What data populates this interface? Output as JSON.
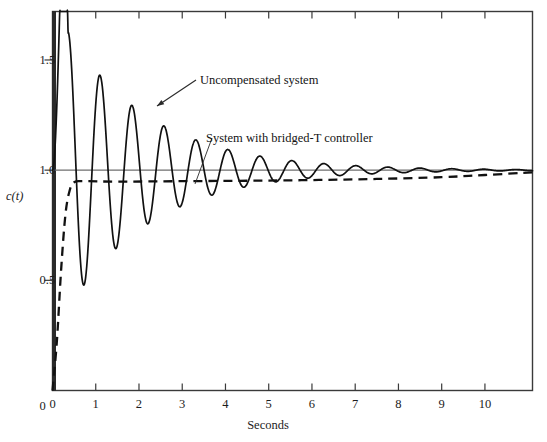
{
  "chart_data": {
    "type": "line",
    "title": "",
    "xlabel": "Seconds",
    "ylabel": "c(t)",
    "xlim": [
      0,
      11.1
    ],
    "ylim": [
      0,
      1.72
    ],
    "grid": false,
    "legend_position": "inline-annotations",
    "x_ticks": [
      0,
      1,
      2,
      3,
      4,
      5,
      6,
      7,
      8,
      9,
      10
    ],
    "x_tick_labels": [
      "0",
      "1",
      "2",
      "3",
      "4",
      "5",
      "6",
      "7",
      "8",
      "9",
      "10"
    ],
    "y_ticks": [
      0,
      0.5,
      1.0,
      1.5
    ],
    "y_tick_labels": [
      "0",
      "0.5",
      "1.0",
      "1.5"
    ],
    "reference_line": {
      "name": "steady-state-line",
      "y": 1.0,
      "style": "solid-thin",
      "color": "#6e6e6e"
    },
    "series": [
      {
        "name": "Uncompensated system",
        "style": "solid",
        "color": "#111111",
        "damping_ratio": 0.055,
        "natural_period_s": 0.74,
        "final_value": 1.0,
        "peaks": [
          {
            "t": 0.36,
            "c": 1.63
          },
          {
            "t": 1.09,
            "c": 1.44
          },
          {
            "t": 1.83,
            "c": 1.3
          },
          {
            "t": 2.55,
            "c": 1.2
          },
          {
            "t": 3.28,
            "c": 1.14
          },
          {
            "t": 4.0,
            "c": 1.11
          },
          {
            "t": 4.74,
            "c": 1.08
          },
          {
            "t": 5.48,
            "c": 1.06
          },
          {
            "t": 6.2,
            "c": 1.05
          },
          {
            "t": 6.94,
            "c": 1.04
          },
          {
            "t": 7.66,
            "c": 1.03
          },
          {
            "t": 8.4,
            "c": 1.02
          },
          {
            "t": 9.12,
            "c": 1.015
          },
          {
            "t": 9.86,
            "c": 1.012
          },
          {
            "t": 10.58,
            "c": 1.01
          }
        ],
        "troughs": [
          {
            "t": 0.73,
            "c": 0.3
          },
          {
            "t": 1.46,
            "c": 0.48
          },
          {
            "t": 2.19,
            "c": 0.62
          },
          {
            "t": 2.92,
            "c": 0.72
          },
          {
            "t": 3.64,
            "c": 0.8
          },
          {
            "t": 4.37,
            "c": 0.86
          },
          {
            "t": 5.11,
            "c": 0.9
          },
          {
            "t": 5.84,
            "c": 0.93
          },
          {
            "t": 6.57,
            "c": 0.95
          },
          {
            "t": 7.3,
            "c": 0.96
          },
          {
            "t": 8.03,
            "c": 0.97
          },
          {
            "t": 8.76,
            "c": 0.98
          },
          {
            "t": 9.49,
            "c": 0.985
          },
          {
            "t": 10.22,
            "c": 0.99
          }
        ]
      },
      {
        "name": "System with bridged-T controller",
        "style": "dashed",
        "color": "#111111",
        "damping_ratio": 0.92,
        "rise_time_s": 0.38,
        "settling_value": 0.95,
        "final_value": 1.0,
        "points": [
          {
            "t": 0.0,
            "c": 0.0
          },
          {
            "t": 0.1,
            "c": 0.22
          },
          {
            "t": 0.2,
            "c": 0.55
          },
          {
            "t": 0.3,
            "c": 0.8
          },
          {
            "t": 0.4,
            "c": 0.91
          },
          {
            "t": 0.5,
            "c": 0.945
          },
          {
            "t": 0.7,
            "c": 0.95
          },
          {
            "t": 1.5,
            "c": 0.948
          },
          {
            "t": 3.0,
            "c": 0.95
          },
          {
            "t": 4.5,
            "c": 0.952
          },
          {
            "t": 6.0,
            "c": 0.955
          },
          {
            "t": 7.5,
            "c": 0.96
          },
          {
            "t": 9.0,
            "c": 0.968
          },
          {
            "t": 10.0,
            "c": 0.978
          },
          {
            "t": 11.1,
            "c": 0.99
          }
        ]
      }
    ],
    "annotations": [
      {
        "name": "uncompensated-system-annotation",
        "text": "Uncompensated system",
        "label_x": 200,
        "label_y": 73,
        "arrow_from": {
          "x": 196,
          "y": 80
        },
        "arrow_to": {
          "x": 157,
          "y": 106
        }
      },
      {
        "name": "bridged-t-controller-annotation",
        "text": "System with bridged-T controller",
        "label_x": 206,
        "label_y": 131,
        "arrow_from": {
          "x": 212,
          "y": 138
        },
        "arrow_to": {
          "x": 195,
          "y": 184
        }
      }
    ]
  },
  "axes": {
    "x_title": "Seconds",
    "y_title": "c(t)"
  },
  "colors": {
    "frame": "#3a3a3a",
    "curve": "#111111",
    "reference": "#6e6e6e",
    "background": "#ffffff"
  }
}
